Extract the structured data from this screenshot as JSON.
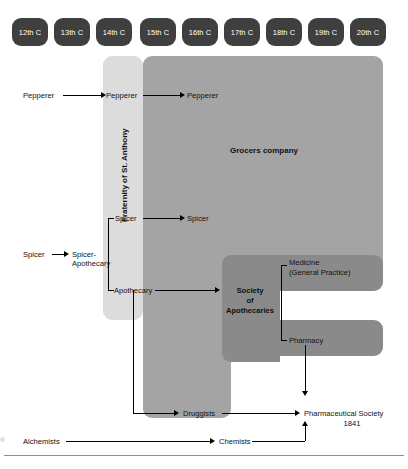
{
  "diagram": {
    "type": "timeline-lineage",
    "timeline": {
      "label": "Centuries",
      "periods": [
        {
          "label": "12th C"
        },
        {
          "label": "13th C"
        },
        {
          "label": "14th C"
        },
        {
          "label": "15th C"
        },
        {
          "label": "16th C"
        },
        {
          "label": "17th C"
        },
        {
          "label": "18th C"
        },
        {
          "label": "19th C"
        },
        {
          "label": "20th C"
        }
      ]
    },
    "bands": [
      {
        "id": "fraternity",
        "label": "Fraternity of St. Anthony",
        "orientation": "vertical",
        "color": "#dcdcdc"
      },
      {
        "id": "grocers",
        "label": "Grocers company",
        "orientation": "horizontal",
        "color": "#a4a4a4"
      },
      {
        "id": "apothecaries",
        "label": "Society of Apothecaries",
        "orientation": "horizontal",
        "color": "#8a8a8a"
      }
    ],
    "nodes": {
      "pepperer_origin": "Pepperer",
      "pepperer_fraternity": "Pepperer",
      "pepperer_grocers": "Pepperer",
      "spicer_origin": "Spicer",
      "spicer_apothecary": "Spicer-\nApothecary",
      "spicer_apothecary_line1": "Spicer-",
      "spicer_apothecary_line2": "Apothecary",
      "spicer_fraternity": "Spicer",
      "spicer_grocers": "Spicer",
      "apothecary": "Apothecary",
      "society_line1": "Society",
      "society_line2": "of",
      "society_line3": "Apothecaries",
      "medicine_line1": "Medicine",
      "medicine_line2": "(General Practice)",
      "pharmacy": "Pharmacy",
      "druggists": "Druggists",
      "alchemists": "Alchemists",
      "chemists": "Chemists",
      "pharm_society_line1": "Pharmaceutical Society",
      "pharm_society_line2": "1841"
    },
    "colors": {
      "pill_fill": "#3f3f3f",
      "pill_text": "#ffffff",
      "band_light": "#dcdcdc",
      "band_mid": "#a4a4a4",
      "band_dark": "#8a8a8a",
      "connector": "#000000",
      "text": "#111111",
      "footer_rule": "#8d8d8d"
    }
  }
}
